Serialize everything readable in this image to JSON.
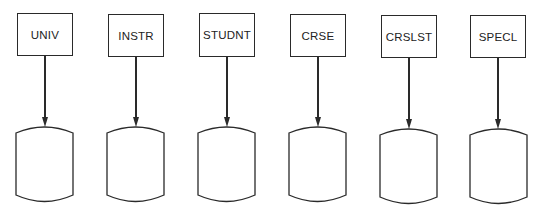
{
  "diagram": {
    "type": "entity-to-file mapping",
    "stroke_color": "#2a2a2a",
    "nodes": [
      {
        "label": "UNIV",
        "box": {
          "x": 17,
          "y": 13,
          "w": 56,
          "h": 43
        },
        "cx": 45
      },
      {
        "label": "INSTR",
        "box": {
          "x": 108,
          "y": 14,
          "w": 56,
          "h": 43
        },
        "cx": 136
      },
      {
        "label": "STUDNT",
        "box": {
          "x": 199,
          "y": 13,
          "w": 56,
          "h": 44
        },
        "cx": 227
      },
      {
        "label": "CRSE",
        "box": {
          "x": 290,
          "y": 14,
          "w": 56,
          "h": 43
        },
        "cx": 318
      },
      {
        "label": "CRSLST",
        "box": {
          "x": 381,
          "y": 15,
          "w": 56,
          "h": 43
        },
        "cx": 409
      },
      {
        "label": "SPECL",
        "box": {
          "x": 470,
          "y": 15,
          "w": 56,
          "h": 43
        },
        "cx": 498
      }
    ],
    "storage_cylinders": [
      {
        "x": 16,
        "w": 57
      },
      {
        "x": 107,
        "w": 57
      },
      {
        "x": 198,
        "w": 57
      },
      {
        "x": 289,
        "w": 57
      },
      {
        "x": 380,
        "w": 57
      },
      {
        "x": 470,
        "w": 57
      }
    ]
  }
}
